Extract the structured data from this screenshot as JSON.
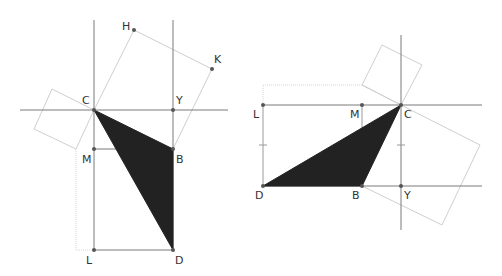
{
  "colors": {
    "axis": "#6b6b6b",
    "construction": "#c8c8c8",
    "fill": "#222222",
    "point": "#555555",
    "label": "#333333"
  },
  "figures": [
    {
      "name": "left-figure",
      "points": {
        "C": {
          "label": "C",
          "x": 94,
          "y": 110
        },
        "Y": {
          "label": "Y",
          "x": 173,
          "y": 110
        },
        "M": {
          "label": "M",
          "x": 94,
          "y": 149
        },
        "B": {
          "label": "B",
          "x": 173,
          "y": 149
        },
        "L": {
          "label": "L",
          "x": 94,
          "y": 250
        },
        "D": {
          "label": "D",
          "x": 173,
          "y": 250
        },
        "H": {
          "label": "H",
          "x": 134,
          "y": 30
        },
        "K": {
          "label": "K",
          "x": 212,
          "y": 69
        }
      },
      "shaded_triangle": [
        "C",
        "B",
        "D"
      ]
    },
    {
      "name": "right-figure",
      "points": {
        "L": {
          "label": "L",
          "x": 263,
          "y": 105
        },
        "M": {
          "label": "M",
          "x": 362,
          "y": 105
        },
        "C": {
          "label": "C",
          "x": 401,
          "y": 105
        },
        "D": {
          "label": "D",
          "x": 263,
          "y": 186
        },
        "B": {
          "label": "B",
          "x": 362,
          "y": 186
        },
        "Y": {
          "label": "Y",
          "x": 401,
          "y": 186
        }
      },
      "shaded_triangle": [
        "C",
        "D",
        "B"
      ]
    }
  ]
}
